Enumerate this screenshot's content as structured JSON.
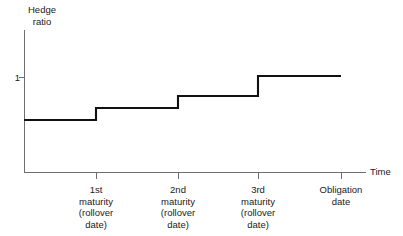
{
  "chart_data": {
    "type": "line",
    "subtype": "step",
    "title": "",
    "ylabel": "Hedge ratio",
    "xlabel": "Time",
    "grid": false,
    "legend": null,
    "y_ticks": [
      {
        "value": 1,
        "label": "1"
      }
    ],
    "ylim": [
      0,
      1.35
    ],
    "xlim": [
      0,
      1
    ],
    "categories": [
      "1st maturity (rollover date)",
      "2nd maturity (rollover date)",
      "3rd maturity (rollover date)",
      "Obligation date"
    ],
    "x_tick_labels": [
      {
        "lines": [
          "1st",
          "maturity",
          "(rollover",
          "date)"
        ]
      },
      {
        "lines": [
          "2nd",
          "maturity",
          "(rollover",
          "date)"
        ]
      },
      {
        "lines": [
          "3rd",
          "maturity",
          "(rollover",
          "date)"
        ]
      },
      {
        "lines": [
          "Obligation",
          "date"
        ]
      }
    ],
    "x_tick_positions_px": [
      96,
      178,
      258,
      341
    ],
    "step_segments": [
      {
        "x_start_px": 24,
        "x_end_px": 96,
        "y_px": 120,
        "value": 0.49
      },
      {
        "x_start_px": 96,
        "x_end_px": 178,
        "y_px": 108,
        "value": 0.62
      },
      {
        "x_start_px": 178,
        "x_end_px": 258,
        "y_px": 96,
        "value": 0.75
      },
      {
        "x_start_px": 258,
        "x_end_px": 341,
        "y_px": 76,
        "value": 1.0
      }
    ],
    "values": [
      0.49,
      0.62,
      0.75,
      1.0
    ],
    "series": [
      {
        "name": "Hedge ratio",
        "values": [
          0.49,
          0.62,
          0.75,
          1.0
        ]
      }
    ],
    "annotations": [],
    "colors": {
      "line": "#111111",
      "axis": "#6e6e6e",
      "background": "#ffffff",
      "text": "#1a1a1a"
    }
  },
  "axes": {
    "y_title_lines": [
      "Hedge",
      "ratio"
    ],
    "x_title": "Time",
    "y_tick_1": "1"
  }
}
